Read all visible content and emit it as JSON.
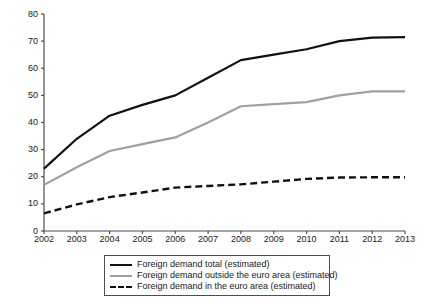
{
  "chart_data": {
    "type": "line",
    "title": "",
    "xlabel": "",
    "ylabel": "",
    "categories": [
      "2002",
      "2003",
      "2004",
      "2005",
      "2006",
      "2007",
      "2008",
      "2009",
      "2010",
      "2011",
      "2012",
      "2013"
    ],
    "x": [
      2002,
      2003,
      2004,
      2005,
      2006,
      2007,
      2008,
      2009,
      2010,
      2011,
      2012,
      2013
    ],
    "xlim": [
      2002,
      2013
    ],
    "ylim": [
      0,
      80
    ],
    "yticks": [
      0,
      10,
      20,
      30,
      40,
      50,
      60,
      70,
      80
    ],
    "grid": false,
    "legend_position": "below-center",
    "series": [
      {
        "name": "Foreign demand total (estimated)",
        "style": "solid",
        "color": "#111111",
        "values": [
          23.0,
          34.0,
          42.5,
          46.5,
          50.0,
          56.5,
          63.0,
          65.0,
          67.0,
          70.0,
          71.3,
          71.5
        ]
      },
      {
        "name": "Foreign demand outside the euro area (estimated)",
        "style": "solid",
        "color": "#a0a0a0",
        "values": [
          17.0,
          23.5,
          29.5,
          32.0,
          34.5,
          40.0,
          46.0,
          46.8,
          47.5,
          50.0,
          51.5,
          51.5
        ]
      },
      {
        "name": "Foreign demand in the euro area (estimated)",
        "style": "dashed",
        "color": "#111111",
        "values": [
          6.5,
          9.8,
          12.5,
          14.2,
          16.0,
          16.6,
          17.2,
          18.2,
          19.2,
          19.7,
          19.8,
          19.8
        ]
      }
    ]
  },
  "legend": {
    "items": [
      {
        "label": "Foreign demand total (estimated)"
      },
      {
        "label": "Foreign demand outside the euro area (estimated)"
      },
      {
        "label": "Foreign demand in the euro area (estimated)"
      }
    ]
  }
}
